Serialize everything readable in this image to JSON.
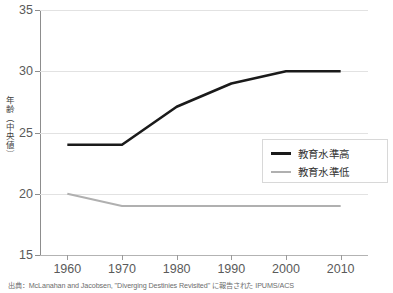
{
  "chart_data": {
    "type": "line",
    "title": "",
    "xlabel": "",
    "ylabel": "年齢（中央値）",
    "x": [
      1960,
      1970,
      1980,
      1990,
      2000,
      2010
    ],
    "xtick_labels": [
      "1960",
      "1970",
      "1980",
      "1990",
      "2000",
      "2010"
    ],
    "ytick_labels": [
      "35",
      "30",
      "25",
      "20",
      "15"
    ],
    "ytick_values": [
      35,
      30,
      25,
      20,
      15
    ],
    "xlim": [
      1955,
      2015
    ],
    "ylim": [
      15,
      35
    ],
    "grid": true,
    "legend_position": "center-right",
    "series": [
      {
        "name": "教育水準高",
        "color": "#1a1a1a",
        "width": 2.6,
        "values": [
          24.0,
          24.0,
          27.1,
          29.0,
          30.0,
          30.0
        ]
      },
      {
        "name": "教育水準低",
        "color": "#b0b0b0",
        "width": 2.0,
        "values": [
          20.0,
          19.0,
          19.0,
          19.0,
          19.0,
          19.0
        ]
      }
    ]
  },
  "legend": {
    "items": [
      {
        "label": "教育水準高"
      },
      {
        "label": "教育水準低"
      }
    ]
  },
  "source_note": "出典：McLanahan and Jacobsen, \"Diverging Destinies Revisited\" に報告された IPUMS/ACS",
  "colors": {
    "high_education": "#1a1a1a",
    "low_education": "#b0b0b0",
    "gridline": "#e2e2e2",
    "axis": "#8d8d8d",
    "text": "#5a5a5a"
  }
}
